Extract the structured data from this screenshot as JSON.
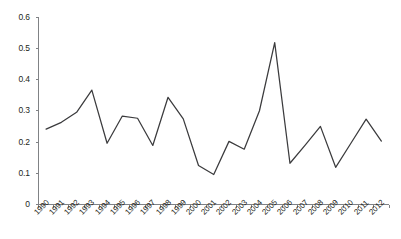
{
  "chart_data": {
    "type": "line",
    "title": "",
    "subtitle": "",
    "xlabel": "",
    "ylabel": "",
    "categories": [
      "1990",
      "1991",
      "1992",
      "1993",
      "1994",
      "1995",
      "1996",
      "1997",
      "1998",
      "1999",
      "2000",
      "2001",
      "2002",
      "2003",
      "2004",
      "2005",
      "2006",
      "2007",
      "2008",
      "2009",
      "2010",
      "2011",
      "2012"
    ],
    "values": [
      0.241,
      0.263,
      0.295,
      0.366,
      0.196,
      0.283,
      0.276,
      0.189,
      0.343,
      0.274,
      0.125,
      0.096,
      0.202,
      0.177,
      0.3,
      0.518,
      0.132,
      0.19,
      0.25,
      0.119,
      0.196,
      0.273,
      0.203
    ],
    "series": [
      {
        "name": "",
        "values": [
          0.241,
          0.263,
          0.295,
          0.366,
          0.196,
          0.283,
          0.276,
          0.189,
          0.343,
          0.274,
          0.125,
          0.096,
          0.202,
          0.177,
          0.3,
          0.518,
          0.132,
          0.19,
          0.25,
          0.119,
          0.196,
          0.273,
          0.203
        ]
      }
    ],
    "ylim": [
      0,
      0.6
    ],
    "ytick_labels": [
      "0",
      "0.1",
      "0.2",
      "0.3",
      "0.4",
      "0.5",
      "0.6"
    ],
    "ytick_values": [
      0,
      0.1,
      0.2,
      0.3,
      0.4,
      0.5,
      0.6
    ],
    "xtick_labels": [
      "1990",
      "1991",
      "1992",
      "1993",
      "1994",
      "1995",
      "1996",
      "1997",
      "1998",
      "1999",
      "2000",
      "2001",
      "2002",
      "2003",
      "2004",
      "2005",
      "2006",
      "2007",
      "2008",
      "2009",
      "2010",
      "2011",
      "2012"
    ],
    "grid": false,
    "legend": false,
    "legend_position": "none",
    "annotations": [],
    "line_color": "#3b3b3d",
    "axis_color": "#808285",
    "background_color": "#ffffff",
    "xtick_label_rotation": -45
  }
}
